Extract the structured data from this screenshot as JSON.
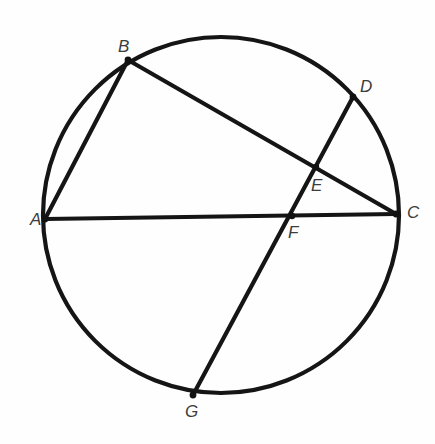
{
  "figure": {
    "background_color": "#fefefe",
    "stroke_color": "#151515",
    "label_color": "#3c3c3c",
    "width": 435,
    "height": 444
  },
  "circle": {
    "name": "circle-outline",
    "center_x": 221,
    "center_y": 215,
    "radius": 178,
    "stroke_width": 4.2
  },
  "points": [
    {
      "id": "A",
      "label": "A",
      "x": 45,
      "y": 219,
      "label_x": 30,
      "label_y": 211
    },
    {
      "id": "B",
      "label": "B",
      "x": 128,
      "y": 60,
      "label_x": 118,
      "label_y": 38
    },
    {
      "id": "C",
      "label": "C",
      "x": 396,
      "y": 214,
      "label_x": 407,
      "label_y": 204
    },
    {
      "id": "D",
      "label": "D",
      "x": 353,
      "y": 97,
      "label_x": 360,
      "label_y": 78
    },
    {
      "id": "E",
      "label": "E",
      "x": 316,
      "y": 167,
      "label_x": 311,
      "label_y": 177
    },
    {
      "id": "F",
      "label": "F",
      "x": 292,
      "y": 216,
      "label_x": 288,
      "label_y": 224
    },
    {
      "id": "G",
      "label": "G",
      "x": 193,
      "y": 395,
      "label_x": 185,
      "label_y": 403
    }
  ],
  "segments": [
    {
      "name": "chord-ab",
      "from": "A",
      "to": "B"
    },
    {
      "name": "chord-ac",
      "from": "A",
      "to": "C"
    },
    {
      "name": "chord-bc",
      "from": "B",
      "to": "C"
    },
    {
      "name": "chord-dg",
      "from": "D",
      "to": "G"
    }
  ],
  "intersections": [
    {
      "name": "intersection-e",
      "point": "E",
      "of": [
        "chord-bc",
        "chord-dg"
      ]
    },
    {
      "name": "intersection-f",
      "point": "F",
      "of": [
        "chord-ac",
        "chord-dg"
      ]
    }
  ]
}
